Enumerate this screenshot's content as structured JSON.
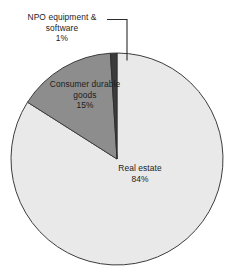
{
  "chart_data": {
    "type": "pie",
    "title": "",
    "subtitle": "",
    "xlabel": "",
    "ylabel": "",
    "legend_position": "none",
    "grid": false,
    "units": "percent",
    "start_angle_deg": 0,
    "direction": "counterclockwise",
    "categories": [
      "NPO equipment & software",
      "Consumer durable goods",
      "Real estate"
    ],
    "values": [
      1,
      15,
      84
    ],
    "slices": [
      {
        "label": "NPO equipment & software",
        "value": 1,
        "value_text": "1%",
        "color": "#3b3b3b",
        "label_placement": "outside-leader-line"
      },
      {
        "label": "Consumer durable goods",
        "value": 15,
        "value_text": "15%",
        "color": "#8d8d8d",
        "label_placement": "inside"
      },
      {
        "label": "Real estate",
        "value": 84,
        "value_text": "84%",
        "color": "#e9e9e9",
        "label_placement": "inside"
      }
    ]
  },
  "labels": {
    "npo": {
      "line1": "NPO equipment &",
      "line2": "software",
      "line3": "1%"
    },
    "consumer": {
      "line1": "Consumer durable",
      "line2": "goods",
      "line3": "15%"
    },
    "real_estate": {
      "line1": "Real estate",
      "line2": "84%"
    }
  },
  "style": {
    "background": "#ffffff",
    "outline": "#3d3d3d",
    "leader_line": "#2b2b2b",
    "text": "#1c1c1c"
  }
}
